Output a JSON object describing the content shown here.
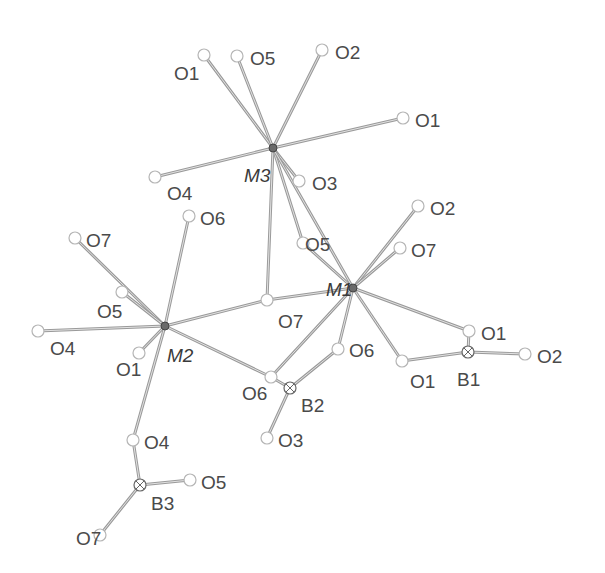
{
  "diagram": {
    "type": "molecular-structure",
    "atoms": [
      {
        "id": "M3",
        "label": "M3",
        "kind": "metal",
        "x": 273,
        "y": 148,
        "lx": 244,
        "ly": 182
      },
      {
        "id": "M1",
        "label": "M1",
        "kind": "metal",
        "x": 353,
        "y": 288,
        "lx": 326,
        "ly": 296
      },
      {
        "id": "M2",
        "label": "M2",
        "kind": "metal",
        "x": 165,
        "y": 326,
        "lx": 167,
        "ly": 362
      },
      {
        "id": "B1",
        "label": "B1",
        "kind": "boron",
        "x": 468,
        "y": 352,
        "lx": 457,
        "ly": 386
      },
      {
        "id": "B2",
        "label": "B2",
        "kind": "boron",
        "x": 290,
        "y": 388,
        "lx": 301,
        "ly": 412
      },
      {
        "id": "B3",
        "label": "B3",
        "kind": "boron",
        "x": 140,
        "y": 485,
        "lx": 151,
        "ly": 510
      },
      {
        "id": "M3_O1a",
        "label": "O1",
        "kind": "oxygen",
        "x": 204,
        "y": 55,
        "lx": 174,
        "ly": 80
      },
      {
        "id": "M3_O5",
        "label": "O5",
        "kind": "oxygen",
        "x": 237,
        "y": 56,
        "lx": 250,
        "ly": 65
      },
      {
        "id": "M3_O2",
        "label": "O2",
        "kind": "oxygen",
        "x": 322,
        "y": 50,
        "lx": 335,
        "ly": 59
      },
      {
        "id": "M3_O1b",
        "label": "O1",
        "kind": "oxygen",
        "x": 403,
        "y": 118,
        "lx": 415,
        "ly": 127
      },
      {
        "id": "M3_O4",
        "label": "O4",
        "kind": "oxygen",
        "x": 155,
        "y": 177,
        "lx": 167,
        "ly": 200
      },
      {
        "id": "M3_O3",
        "label": "O3",
        "kind": "oxygen",
        "x": 299,
        "y": 181,
        "lx": 312,
        "ly": 190
      },
      {
        "id": "M1_O5",
        "label": "O5",
        "kind": "oxygen",
        "x": 303,
        "y": 243,
        "lx": 305,
        "ly": 251
      },
      {
        "id": "M1_O2",
        "label": "O2",
        "kind": "oxygen",
        "x": 418,
        "y": 206,
        "lx": 430,
        "ly": 215
      },
      {
        "id": "M1_O7",
        "label": "O7",
        "kind": "oxygen",
        "x": 400,
        "y": 248,
        "lx": 411,
        "ly": 257
      },
      {
        "id": "O7_bridge",
        "label": "O7",
        "kind": "oxygen",
        "x": 267,
        "y": 300,
        "lx": 278,
        "ly": 328
      },
      {
        "id": "M1_O6",
        "label": "O6",
        "kind": "oxygen",
        "x": 338,
        "y": 349,
        "lx": 349,
        "ly": 357
      },
      {
        "id": "M1_O1a",
        "label": "O1",
        "kind": "oxygen",
        "x": 469,
        "y": 331,
        "lx": 481,
        "ly": 340
      },
      {
        "id": "M1_O1b",
        "label": "O1",
        "kind": "oxygen",
        "x": 402,
        "y": 361,
        "lx": 410,
        "ly": 388
      },
      {
        "id": "B1_O2",
        "label": "O2",
        "kind": "oxygen",
        "x": 525,
        "y": 354,
        "lx": 537,
        "ly": 363
      },
      {
        "id": "O6_lower",
        "label": "O6",
        "kind": "oxygen",
        "x": 271,
        "y": 377,
        "lx": 242,
        "ly": 400
      },
      {
        "id": "B2_O3",
        "label": "O3",
        "kind": "oxygen",
        "x": 267,
        "y": 438,
        "lx": 278,
        "ly": 447
      },
      {
        "id": "M2_O6",
        "label": "O6",
        "kind": "oxygen",
        "x": 189,
        "y": 216,
        "lx": 200,
        "ly": 225
      },
      {
        "id": "M2_O7",
        "label": "O7",
        "kind": "oxygen",
        "x": 75,
        "y": 238,
        "lx": 86,
        "ly": 247
      },
      {
        "id": "M2_O5",
        "label": "O5",
        "kind": "oxygen",
        "x": 122,
        "y": 292,
        "lx": 97,
        "ly": 318
      },
      {
        "id": "M2_O4",
        "label": "O4",
        "kind": "oxygen",
        "x": 38,
        "y": 331,
        "lx": 50,
        "ly": 355
      },
      {
        "id": "M2_O1",
        "label": "O1",
        "kind": "oxygen",
        "x": 139,
        "y": 353,
        "lx": 116,
        "ly": 376
      },
      {
        "id": "B3_O4",
        "label": "O4",
        "kind": "oxygen",
        "x": 133,
        "y": 440,
        "lx": 144,
        "ly": 449
      },
      {
        "id": "B3_O5",
        "label": "O5",
        "kind": "oxygen",
        "x": 190,
        "y": 480,
        "lx": 201,
        "ly": 489
      },
      {
        "id": "B3_O7",
        "label": "O7",
        "kind": "oxygen",
        "x": 100,
        "y": 535,
        "lx": 76,
        "ly": 545
      }
    ],
    "bonds": [
      [
        "M3",
        "M3_O1a"
      ],
      [
        "M3",
        "M3_O5"
      ],
      [
        "M3",
        "M3_O2"
      ],
      [
        "M3",
        "M3_O1b"
      ],
      [
        "M3",
        "M3_O4"
      ],
      [
        "M3",
        "M3_O3"
      ],
      [
        "M3",
        "M1_O5"
      ],
      [
        "M3",
        "O7_bridge"
      ],
      [
        "M3",
        "M1"
      ],
      [
        "M1",
        "M1_O5"
      ],
      [
        "M1",
        "M1_O2"
      ],
      [
        "M1",
        "M1_O7"
      ],
      [
        "M1",
        "O7_bridge"
      ],
      [
        "M1",
        "M1_O6"
      ],
      [
        "M1",
        "O6_lower"
      ],
      [
        "M1",
        "M1_O1a"
      ],
      [
        "M1",
        "M1_O1b"
      ],
      [
        "B1",
        "M1_O1a"
      ],
      [
        "B1",
        "M1_O1b"
      ],
      [
        "B1",
        "B1_O2"
      ],
      [
        "B2",
        "O6_lower"
      ],
      [
        "B2",
        "M1_O6"
      ],
      [
        "B2",
        "B2_O3"
      ],
      [
        "M2",
        "M2_O6"
      ],
      [
        "M2",
        "M2_O7"
      ],
      [
        "M2",
        "M2_O5"
      ],
      [
        "M2",
        "M2_O4"
      ],
      [
        "M2",
        "M2_O1"
      ],
      [
        "M2",
        "O7_bridge"
      ],
      [
        "M2",
        "O6_lower"
      ],
      [
        "M2",
        "B3_O4"
      ],
      [
        "B3",
        "B3_O4"
      ],
      [
        "B3",
        "B3_O5"
      ],
      [
        "B3",
        "B3_O7"
      ]
    ]
  }
}
